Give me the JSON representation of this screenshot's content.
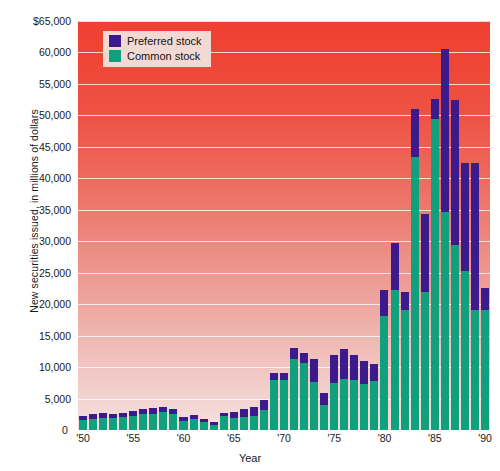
{
  "chart_data": {
    "type": "bar",
    "stacked": true,
    "title": "",
    "xlabel": "Year",
    "ylabel": "New securities issued, in millions of dollars",
    "ylim": [
      0,
      65000
    ],
    "ytick_values": [
      0,
      5000,
      10000,
      15000,
      20000,
      25000,
      30000,
      35000,
      40000,
      45000,
      50000,
      55000,
      60000,
      65000
    ],
    "ytick_labels": [
      "0",
      "5,000",
      "10,000",
      "15,000",
      "20,000",
      "25,000",
      "30,000",
      "35,000",
      "40,000",
      "45,000",
      "50,000",
      "55,000",
      "60,000",
      "$65,000"
    ],
    "grid": true,
    "grid_color": "#ffffff",
    "legend_position": "top-left",
    "categories": [
      "'50",
      "'51",
      "'52",
      "'53",
      "'54",
      "'55",
      "'56",
      "'57",
      "'58",
      "'59",
      "'60",
      "'61",
      "'62",
      "'63",
      "'64",
      "'65",
      "'66",
      "'67",
      "'68",
      "'69",
      "'70",
      "'71",
      "'72",
      "'73",
      "'74",
      "'75",
      "'76",
      "'77",
      "'78",
      "'79",
      "'80",
      "'81",
      "'82",
      "'83",
      "'84",
      "'85",
      "'86",
      "'87",
      "'88",
      "'89",
      "'90"
    ],
    "xtick_labels": [
      "'50",
      "'55",
      "'60",
      "'65",
      "'70",
      "'75",
      "'80",
      "'85",
      "'90"
    ],
    "xtick_categories": [
      "'50",
      "'55",
      "'60",
      "'65",
      "'70",
      "'75",
      "'80",
      "'85",
      "'90"
    ],
    "series": [
      {
        "name": "Common stock",
        "color": "#11a07d",
        "values": [
          1600,
          1800,
          1900,
          1900,
          2000,
          2300,
          2500,
          2600,
          2800,
          2600,
          1400,
          1800,
          1200,
          800,
          2300,
          1900,
          2100,
          2300,
          3200,
          8000,
          8000,
          11300,
          10700,
          7700,
          4000,
          7400,
          8100,
          8000,
          7300,
          7800,
          18100,
          22300,
          19000,
          43400,
          21900,
          49400,
          34700,
          29400,
          25200,
          19100,
          19100
        ],
        "units": "millions of dollars"
      },
      {
        "name": "Preferred stock",
        "color": "#3b1a8c",
        "values": [
          700,
          700,
          800,
          700,
          700,
          700,
          800,
          900,
          900,
          700,
          700,
          600,
          500,
          400,
          400,
          1000,
          1200,
          1300,
          1500,
          1000,
          1000,
          1700,
          1500,
          3600,
          1900,
          4600,
          4700,
          4000,
          3700,
          2700,
          4200,
          7400,
          3000,
          7600,
          12500,
          3200,
          25800,
          23000,
          17300,
          23400,
          3500
        ],
        "units": "millions of dollars"
      }
    ]
  },
  "legend": {
    "items": [
      {
        "label": "Preferred stock",
        "color": "#3b1a8c"
      },
      {
        "label": "Common stock",
        "color": "#11a07d"
      }
    ]
  },
  "axes": {
    "y_title": "New securities issued, in millions of dollars",
    "x_title": "Year",
    "zero_label": "0"
  }
}
